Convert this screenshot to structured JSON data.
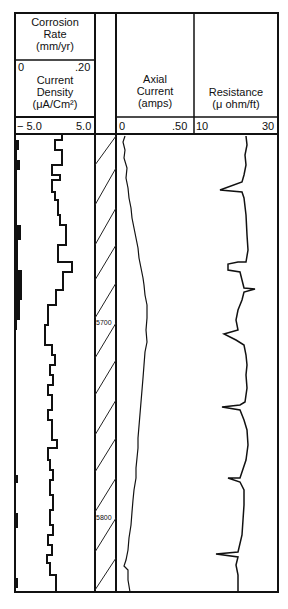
{
  "tracks": {
    "corrosion": {
      "title_lines": [
        "Corrosion",
        "Rate",
        "(mm/yr)"
      ],
      "min": "0",
      "max": ".20"
    },
    "current_density": {
      "title_lines": [
        "Current",
        "Density",
        "(μA/Cm²)"
      ],
      "min": "− 5.0",
      "max": "5.0"
    },
    "axial": {
      "title_lines": [
        "Axial",
        "Current",
        "(amps)"
      ],
      "min": "0",
      "max": ".50"
    },
    "resistance": {
      "title_lines": [
        "Resistance",
        "(μ ohm/ft)"
      ],
      "min": "10",
      "max": "30"
    }
  },
  "depth_labels": [
    "5700",
    "5800"
  ]
}
